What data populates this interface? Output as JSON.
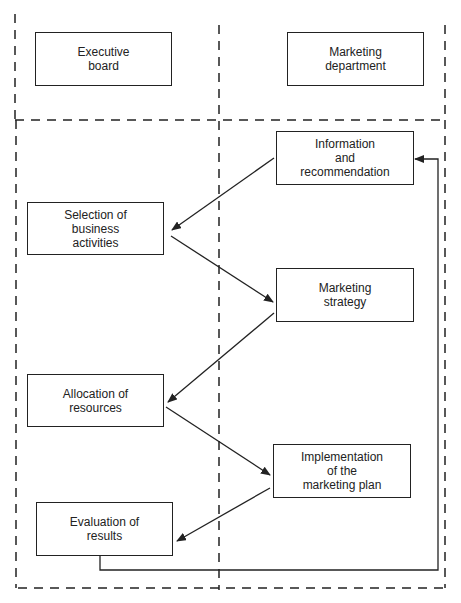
{
  "colors": {
    "line": "#222222",
    "background": "#ffffff"
  },
  "headers": {
    "left": "Executive\nboard",
    "right": "Marketing\ndepartment"
  },
  "steps": [
    {
      "id": "info",
      "label": "Information\nand\nrecommendation",
      "column": "marketing"
    },
    {
      "id": "selection",
      "label": "Selection of\nbusiness\nactivities",
      "column": "executive"
    },
    {
      "id": "strategy",
      "label": "Marketing\nstrategy",
      "column": "marketing"
    },
    {
      "id": "allocation",
      "label": "Allocation of\nresources",
      "column": "executive"
    },
    {
      "id": "implementation",
      "label": "Implementation\nof the\nmarketing plan",
      "column": "marketing"
    },
    {
      "id": "evaluation",
      "label": "Evaluation of\nresults",
      "column": "executive"
    }
  ],
  "flows": [
    {
      "from": "info",
      "to": "selection"
    },
    {
      "from": "selection",
      "to": "strategy"
    },
    {
      "from": "strategy",
      "to": "allocation"
    },
    {
      "from": "allocation",
      "to": "implementation"
    },
    {
      "from": "implementation",
      "to": "evaluation"
    },
    {
      "from": "evaluation",
      "to": "info",
      "type": "feedback-loop"
    }
  ]
}
